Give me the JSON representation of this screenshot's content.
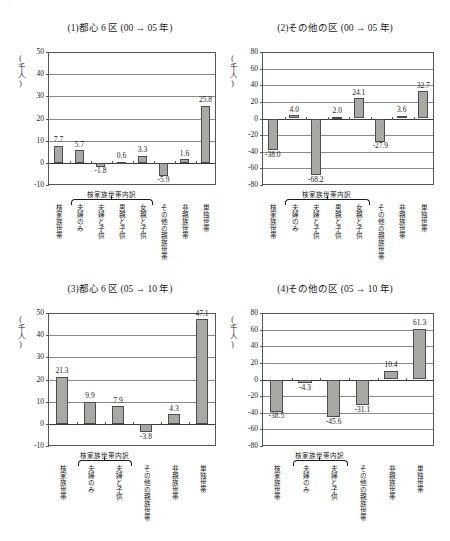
{
  "top_scan_line": "  .  ",
  "unit_label": "(千人)",
  "categories_8": [
    "核家族世帯",
    "夫婦のみ",
    "夫婦と子供",
    "男親と子供",
    "女親と子供",
    "その他の親族世帯",
    "非親族世帯",
    "単独世帯"
  ],
  "categories_6": [
    "核家族世帯",
    "夫婦のみ",
    "夫婦と子供",
    "その他の親族世帯",
    "非親族世帯",
    "単独世帯"
  ],
  "group_header": "核家族世帯内訳",
  "chart_data": [
    {
      "id": "panel1",
      "type": "bar",
      "title": "(1)都心 6 区 (00 → 05 年)",
      "ylabel": "(千人)",
      "xlabel": "",
      "ylim": [
        -10,
        50
      ],
      "yticks": [
        50,
        40,
        30,
        20,
        10,
        0,
        -10
      ],
      "ytick_labels": [
        "50",
        "40",
        "30",
        "20",
        "10",
        "0",
        "-10"
      ],
      "grid": true,
      "legend": "none",
      "categories": [
        "核家族世帯",
        "夫婦のみ",
        "夫婦と子供",
        "男親と子供",
        "女親と子供",
        "その他の親族世帯",
        "非親族世帯",
        "単独世帯"
      ],
      "values": [
        7.7,
        5.7,
        -1.8,
        0.6,
        3.3,
        -5.9,
        1.6,
        25.8
      ],
      "value_labels": [
        "7.7",
        "5.7",
        "-1.8",
        "0.6",
        "3.3",
        "-5.9",
        "1.6",
        "25.8"
      ]
    },
    {
      "id": "panel2",
      "type": "bar",
      "title": "(2)その他の区 (00 → 05 年)",
      "ylabel": "(千人)",
      "xlabel": "",
      "ylim": [
        -80,
        80
      ],
      "yticks": [
        80,
        60,
        40,
        20,
        0,
        -20,
        -40,
        -60,
        -80
      ],
      "ytick_labels": [
        "80",
        "60",
        "40",
        "20",
        "0",
        "-20",
        "-40",
        "-60",
        "-80"
      ],
      "grid": true,
      "legend": "none",
      "categories": [
        "核家族世帯",
        "夫婦のみ",
        "夫婦と子供",
        "男親と子供",
        "女親と子供",
        "その他の親族世帯",
        "非親族世帯",
        "単独世帯"
      ],
      "values": [
        -38.0,
        4.0,
        -68.2,
        2.0,
        24.1,
        -27.9,
        3.6,
        32.7
      ],
      "value_labels": [
        "-38.0",
        "4.0",
        "-68.2",
        "2.0",
        "24.1",
        "-27.9",
        "3.6",
        "32.7"
      ]
    },
    {
      "id": "panel3",
      "type": "bar",
      "title": "(3)都心 6 区 (05 → 10 年)",
      "ylabel": "(千人)",
      "xlabel": "",
      "ylim": [
        -10,
        50
      ],
      "yticks": [
        50,
        40,
        30,
        20,
        10,
        0,
        -10
      ],
      "ytick_labels": [
        "50",
        "40",
        "30",
        "20",
        "10",
        "0",
        "-10"
      ],
      "grid": true,
      "legend": "none",
      "categories": [
        "核家族世帯",
        "夫婦のみ",
        "夫婦と子供",
        "その他の親族世帯",
        "非親族世帯",
        "単独世帯"
      ],
      "values": [
        21.3,
        9.9,
        7.9,
        -3.8,
        4.3,
        47.1
      ],
      "value_labels": [
        "21.3",
        "9.9",
        "7.9",
        "-3.8",
        "4.3",
        "47.1"
      ]
    },
    {
      "id": "panel4",
      "type": "bar",
      "title": "(4)その他の区 (05 → 10 年)",
      "ylabel": "(千人)",
      "xlabel": "",
      "ylim": [
        -80,
        80
      ],
      "yticks": [
        80,
        60,
        40,
        20,
        0,
        -20,
        -40,
        -60,
        -80
      ],
      "ytick_labels": [
        "80",
        "60",
        "40",
        "20",
        "0",
        "-20",
        "-40",
        "-60",
        "-80"
      ],
      "grid": true,
      "legend": "none",
      "categories": [
        "核家族世帯",
        "夫婦のみ",
        "夫婦と子供",
        "その他の親族世帯",
        "非親族世帯",
        "単独世帯"
      ],
      "values": [
        -38.5,
        -4.3,
        -45.6,
        -31.1,
        10.4,
        61.3
      ],
      "value_labels": [
        "-38.5",
        "-4.3",
        "-45.6",
        "-31.1",
        "10.4",
        "61.3"
      ]
    }
  ]
}
